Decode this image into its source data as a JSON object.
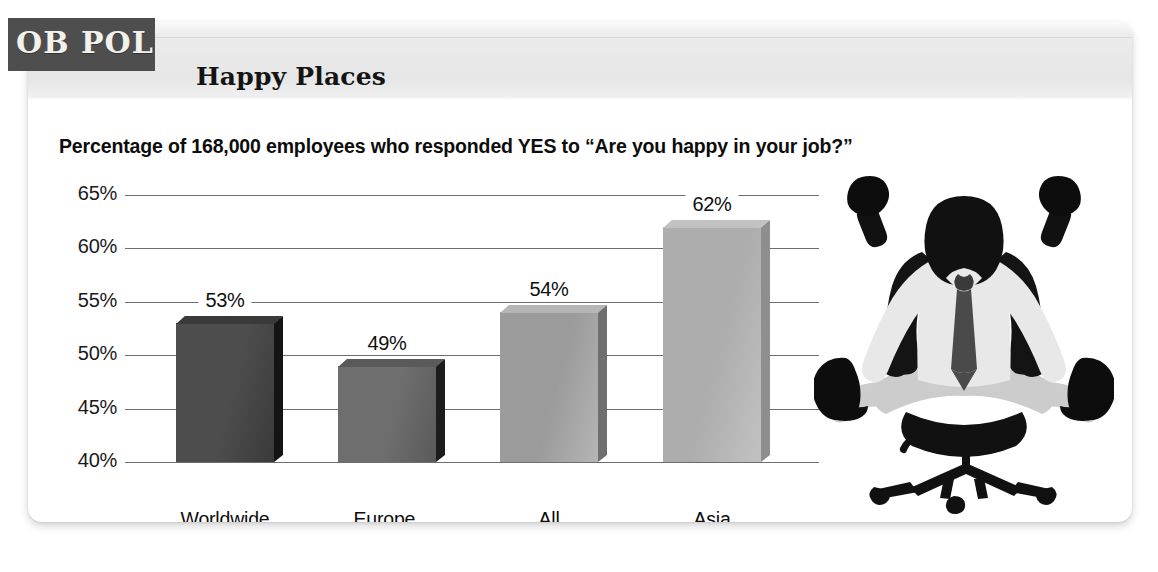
{
  "badge": {
    "label": "OB POLL"
  },
  "header": {
    "title": "Happy Places"
  },
  "chart_data": {
    "type": "bar",
    "title": "Happy Places",
    "subtitle": "Percentage of 168,000 employees who responded YES to “Are you happy in your job?”",
    "categories": [
      "Worldwide average",
      "Europe, Middle East, and Africa",
      "All Americas",
      "Asia Pacific"
    ],
    "category_lines": [
      [
        "Worldwide",
        "average"
      ],
      [
        "Europe,",
        "Middle East,",
        "and Africa"
      ],
      [
        "All",
        "Americas"
      ],
      [
        "Asia",
        "Pacific"
      ]
    ],
    "values": [
      53,
      49,
      54,
      62
    ],
    "value_labels": [
      "53%",
      "49%",
      "54%",
      "62%"
    ],
    "xlabel": "",
    "ylabel": "",
    "ylim": [
      40,
      65
    ],
    "yticks": [
      65,
      60,
      55,
      50,
      45,
      40
    ],
    "ytick_labels": [
      "65%",
      "60%",
      "55%",
      "50%",
      "45%",
      "40%"
    ],
    "grid": true,
    "legend": "none",
    "unit": "percent",
    "bar_colors": [
      "#4d4d4d",
      "#6e6e6e",
      "#9b9b9b",
      "#adadad"
    ],
    "bar_side_colors": [
      "#141414",
      "#1c1c1c",
      "#6f6f6f",
      "#8e8e8e"
    ],
    "bar_top_colors": [
      "#3a3a3a",
      "#5a5a5a",
      "#b5b5b5",
      "#c2c2c2"
    ]
  },
  "colors": {
    "badge_bg": "#4e4e4e",
    "header_band": "#e6e6e6",
    "gridline": "#6d6d6d",
    "text": "#0d0d0d",
    "card_bg": "#ffffff"
  },
  "illustration": {
    "name": "celebrating-office-worker-silhouette",
    "description": "Silhouette of a seated businessman in an office chair with arms raised in celebration"
  }
}
